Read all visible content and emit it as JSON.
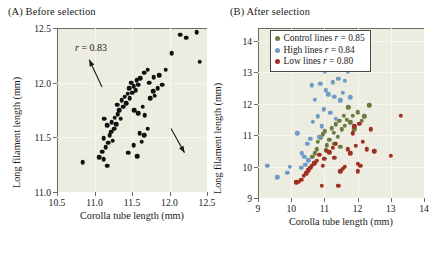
{
  "figure": {
    "background": "#ffffff",
    "plot_background": "#edece1",
    "grid_color": "#f7f7f0",
    "axis_color": "#6b6b63"
  },
  "panels": [
    {
      "key": "A",
      "label": "(A)  Before selection",
      "annotation": "r = 0.83"
    },
    {
      "key": "B",
      "label": "(B)  After selection"
    }
  ],
  "legend": {
    "position": "top-left-inside",
    "entries": [
      {
        "label": "Control lines r = 0.85",
        "color": "#6c7a3e",
        "name": "control-lines"
      },
      {
        "label": "High lines r = 0.84",
        "color": "#6e9bc5",
        "name": "high-lines"
      },
      {
        "label": "Low lines r = 0.80",
        "color": "#9e2f21",
        "name": "low-lines"
      }
    ]
  },
  "chart_data": [
    {
      "type": "scatter",
      "panel": "A",
      "title": "(A)  Before selection",
      "xlabel": "Corolla tube length (mm)",
      "ylabel": "Long filament length (mm)",
      "xlim": [
        10.5,
        12.5
      ],
      "ylim": [
        11.0,
        12.5
      ],
      "xticks": [
        10.5,
        11.0,
        11.5,
        12.0,
        12.5
      ],
      "xtick_labels": [
        "10.5",
        "11.0",
        "11.5",
        "12.0",
        "12.5"
      ],
      "yticks": [
        11.0,
        11.5,
        12.0,
        12.5
      ],
      "ytick_labels": [
        "11.0",
        "11.5",
        "12.0",
        "12.5"
      ],
      "grid": true,
      "legend": "none",
      "annotations": [
        {
          "text": "r = 0.83",
          "x": 10.74,
          "y": 12.37,
          "italic_prefix": "r"
        },
        {
          "type": "arrow",
          "name": "up-left-arrow",
          "x1": 11.1,
          "y1": 11.96,
          "x2": 10.93,
          "y2": 12.21
        },
        {
          "type": "arrow",
          "name": "down-right-arrow",
          "x1": 12.02,
          "y1": 11.58,
          "x2": 12.2,
          "y2": 11.36
        }
      ],
      "series": [
        {
          "name": "individuals",
          "color": "#111111",
          "marker": "circle",
          "points": [
            [
              10.84,
              11.27
            ],
            [
              11.06,
              11.32
            ],
            [
              11.12,
              11.3
            ],
            [
              11.17,
              11.24
            ],
            [
              11.1,
              11.37
            ],
            [
              11.15,
              11.41
            ],
            [
              11.18,
              11.45
            ],
            [
              11.12,
              11.49
            ],
            [
              11.2,
              11.52
            ],
            [
              11.24,
              11.47
            ],
            [
              11.22,
              11.55
            ],
            [
              11.26,
              11.58
            ],
            [
              11.17,
              11.61
            ],
            [
              11.23,
              11.64
            ],
            [
              11.29,
              11.62
            ],
            [
              11.27,
              11.68
            ],
            [
              11.13,
              11.67
            ],
            [
              11.31,
              11.71
            ],
            [
              11.35,
              11.67
            ],
            [
              11.33,
              11.75
            ],
            [
              11.38,
              11.78
            ],
            [
              11.3,
              11.8
            ],
            [
              11.36,
              11.84
            ],
            [
              11.42,
              11.81
            ],
            [
              11.4,
              11.87
            ],
            [
              11.44,
              11.9
            ],
            [
              11.47,
              11.86
            ],
            [
              11.5,
              11.91
            ],
            [
              11.46,
              11.95
            ],
            [
              11.52,
              11.97
            ],
            [
              11.55,
              11.93
            ],
            [
              11.49,
              12.0
            ],
            [
              11.56,
              12.02
            ],
            [
              11.58,
              11.98
            ],
            [
              11.61,
              12.04
            ],
            [
              11.53,
              11.75
            ],
            [
              11.58,
              11.72
            ],
            [
              11.64,
              11.78
            ],
            [
              11.67,
              11.7
            ],
            [
              11.6,
              11.54
            ],
            [
              11.66,
              11.52
            ],
            [
              11.71,
              11.58
            ],
            [
              11.52,
              11.43
            ],
            [
              11.63,
              11.46
            ],
            [
              11.45,
              11.36
            ],
            [
              11.57,
              11.33
            ],
            [
              11.74,
              11.86
            ],
            [
              11.78,
              11.92
            ],
            [
              11.8,
              11.88
            ],
            [
              11.84,
              11.95
            ],
            [
              11.73,
              12.0
            ],
            [
              11.79,
              12.05
            ],
            [
              11.86,
              12.07
            ],
            [
              11.66,
              12.09
            ],
            [
              11.71,
              12.12
            ],
            [
              11.9,
              11.98
            ],
            [
              11.95,
              12.12
            ],
            [
              12.03,
              12.27
            ],
            [
              12.14,
              12.44
            ],
            [
              12.22,
              12.41
            ],
            [
              12.36,
              12.46
            ],
            [
              12.4,
              12.19
            ]
          ]
        }
      ]
    },
    {
      "type": "scatter",
      "panel": "B",
      "title": "(B)  After selection",
      "xlabel": "Corolla tube length (mm)",
      "ylabel": "Long filament length (mm)",
      "xlim": [
        9,
        14
      ],
      "ylim": [
        9,
        14.4
      ],
      "xticks": [
        9,
        10,
        11,
        12,
        13,
        14
      ],
      "xtick_labels": [
        "9",
        "10",
        "11",
        "12",
        "13",
        "14"
      ],
      "yticks": [
        9,
        10,
        11,
        12,
        13,
        14
      ],
      "ytick_labels": [
        "9",
        "10",
        "11",
        "12",
        "13",
        "14"
      ],
      "grid": true,
      "legend": "upper-left",
      "series": [
        {
          "name": "Control lines",
          "r": 0.85,
          "color": "#6c7a3e",
          "marker": "circle",
          "points": [
            [
              10.63,
              10.3
            ],
            [
              10.72,
              10.42
            ],
            [
              10.78,
              10.55
            ],
            [
              10.8,
              10.78
            ],
            [
              10.88,
              10.92
            ],
            [
              10.95,
              11.02
            ],
            [
              11.02,
              11.12
            ],
            [
              11.08,
              10.68
            ],
            [
              11.15,
              10.85
            ],
            [
              11.22,
              11.22
            ],
            [
              11.28,
              11.08
            ],
            [
              11.35,
              11.34
            ],
            [
              11.4,
              10.95
            ],
            [
              11.45,
              11.45
            ],
            [
              11.52,
              11.18
            ],
            [
              11.58,
              11.62
            ],
            [
              11.62,
              11.3
            ],
            [
              11.68,
              11.48
            ],
            [
              11.72,
              11.88
            ],
            [
              11.78,
              11.4
            ],
            [
              11.85,
              11.62
            ],
            [
              11.9,
              11.18
            ],
            [
              12.0,
              11.72
            ],
            [
              12.12,
              11.45
            ],
            [
              12.2,
              11.6
            ],
            [
              12.35,
              11.95
            ],
            [
              11.05,
              10.52
            ],
            [
              11.3,
              10.72
            ],
            [
              11.48,
              10.62
            ],
            [
              10.7,
              10.12
            ]
          ]
        },
        {
          "name": "High lines",
          "r": 0.84,
          "color": "#6e9bc5",
          "marker": "circle",
          "points": [
            [
              9.28,
              10.02
            ],
            [
              9.58,
              9.66
            ],
            [
              9.95,
              10.0
            ],
            [
              9.88,
              9.8
            ],
            [
              10.18,
              11.06
            ],
            [
              10.32,
              10.42
            ],
            [
              10.4,
              10.3
            ],
            [
              10.48,
              10.72
            ],
            [
              10.52,
              10.2
            ],
            [
              10.58,
              10.88
            ],
            [
              10.62,
              12.58
            ],
            [
              10.65,
              11.42
            ],
            [
              10.72,
              12.12
            ],
            [
              10.8,
              11.6
            ],
            [
              10.88,
              12.62
            ],
            [
              10.92,
              11.28
            ],
            [
              10.98,
              11.82
            ],
            [
              11.02,
              13.02
            ],
            [
              11.05,
              12.42
            ],
            [
              11.12,
              12.3
            ],
            [
              11.18,
              11.7
            ],
            [
              11.25,
              12.68
            ],
            [
              11.3,
              12.22
            ],
            [
              11.35,
              11.52
            ],
            [
              11.42,
              12.78
            ],
            [
              11.48,
              12.1
            ],
            [
              11.55,
              12.35
            ],
            [
              11.62,
              12.72
            ],
            [
              11.7,
              13.0
            ],
            [
              11.78,
              12.2
            ],
            [
              10.42,
              10.05
            ],
            [
              10.3,
              9.95
            ],
            [
              10.85,
              10.95
            ]
          ]
        },
        {
          "name": "Low lines",
          "r": 0.8,
          "color": "#9e2f21",
          "marker": "circle",
          "points": [
            [
              10.15,
              9.5
            ],
            [
              10.22,
              9.52
            ],
            [
              10.3,
              9.58
            ],
            [
              10.38,
              9.7
            ],
            [
              10.45,
              9.78
            ],
            [
              10.52,
              9.88
            ],
            [
              10.58,
              9.95
            ],
            [
              10.62,
              10.02
            ],
            [
              10.7,
              10.1
            ],
            [
              10.78,
              10.18
            ],
            [
              10.85,
              10.38
            ],
            [
              10.92,
              9.38
            ],
            [
              11.0,
              10.25
            ],
            [
              11.08,
              10.5
            ],
            [
              11.15,
              10.45
            ],
            [
              11.25,
              10.6
            ],
            [
              11.35,
              10.72
            ],
            [
              11.42,
              9.38
            ],
            [
              11.48,
              9.85
            ],
            [
              11.55,
              9.92
            ],
            [
              11.62,
              10.0
            ],
            [
              11.7,
              10.55
            ],
            [
              11.78,
              10.42
            ],
            [
              11.85,
              11.05
            ],
            [
              11.9,
              11.28
            ],
            [
              11.95,
              10.65
            ],
            [
              12.0,
              10.08
            ],
            [
              12.05,
              11.35
            ],
            [
              12.08,
              10.02
            ],
            [
              12.15,
              10.78
            ],
            [
              12.28,
              10.55
            ],
            [
              12.4,
              11.18
            ],
            [
              12.5,
              10.48
            ],
            [
              13.0,
              10.35
            ],
            [
              13.3,
              11.62
            ],
            [
              12.0,
              9.85
            ],
            [
              11.3,
              10.28
            ],
            [
              10.95,
              10.02
            ]
          ]
        }
      ]
    }
  ]
}
